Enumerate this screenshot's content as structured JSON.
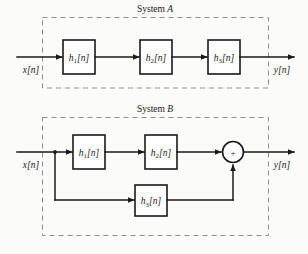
{
  "figure": {
    "type": "block-diagram",
    "background_color": "#fbfbfa",
    "line_color": "#1a1a1a",
    "frame_color": "#8d8d8d",
    "width": 308,
    "height": 254
  },
  "system_a": {
    "title_prefix": "System ",
    "title_name": "A",
    "title_full": "System A",
    "input_label": "x[n]",
    "output_label": "y[n]",
    "blocks": [
      {
        "id": "a-h1",
        "base": "h",
        "sub": "1",
        "bracket": "[n]",
        "label": "h1[n]"
      },
      {
        "id": "a-h2",
        "base": "h",
        "sub": "2",
        "bracket": "[n]",
        "label": "h2[n]"
      },
      {
        "id": "a-h3",
        "base": "h",
        "sub": "3",
        "bracket": "[n]",
        "label": "h3[n]"
      }
    ],
    "topology": "cascade",
    "connections": [
      "x[n] -> h1[n]",
      "h1[n] -> h2[n]",
      "h2[n] -> h3[n]",
      "h3[n] -> y[n]"
    ]
  },
  "system_b": {
    "title_prefix": "System ",
    "title_name": "B",
    "title_full": "System B",
    "input_label": "x[n]",
    "output_label": "y[n]",
    "blocks": [
      {
        "id": "b-h1",
        "base": "h",
        "sub": "1",
        "bracket": "[n]",
        "label": "h1[n]"
      },
      {
        "id": "b-h2",
        "base": "h",
        "sub": "2",
        "bracket": "[n]",
        "label": "h2[n]"
      },
      {
        "id": "b-h3",
        "base": "h",
        "sub": "3",
        "bracket": "[n]",
        "label": "h3[n]"
      }
    ],
    "adder_symbol": "+",
    "topology": "parallel-with-cascade-branch",
    "connections": [
      "x[n] -> h1[n]",
      "h1[n] -> h2[n]",
      "h2[n] -> adder",
      "x[n] -> h3[n]",
      "h3[n] -> adder",
      "adder -> y[n]"
    ]
  }
}
